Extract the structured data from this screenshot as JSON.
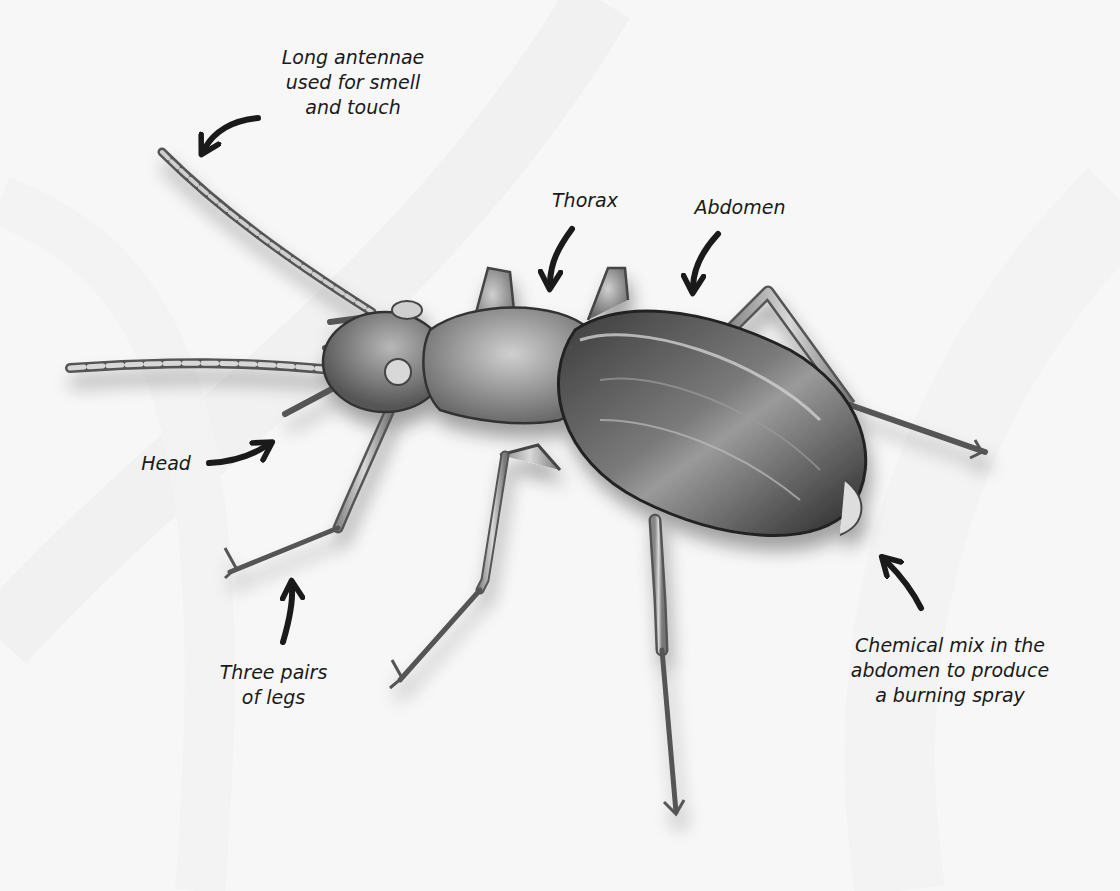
{
  "diagram": {
    "colors": {
      "background": "#f7f7f7",
      "arrow": "#1a1a1a",
      "body_dark": "#2a2a2a",
      "body_mid": "#6e6e6e",
      "body_light": "#c8c8c8",
      "text": "#1a1a1a"
    },
    "labels": {
      "antennae": [
        "Long antennae",
        "used for smell",
        "and touch"
      ],
      "thorax": [
        "Thorax"
      ],
      "abdomen": [
        "Abdomen"
      ],
      "head": [
        "Head"
      ],
      "legs": [
        "Three pairs",
        "of legs"
      ],
      "chemical": [
        "Chemical mix in the",
        "abdomen to produce",
        "a burning spray"
      ]
    }
  }
}
